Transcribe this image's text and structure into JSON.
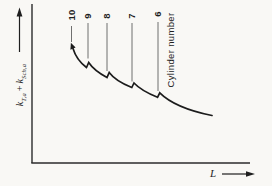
{
  "figure": {
    "y_axis": {
      "k1": "k",
      "k1_sub": "T,a",
      "plus": "+",
      "k2": "k",
      "k2_sub": "Sch,a"
    },
    "x_axis": {
      "label": "L"
    },
    "cylinder_annotation": "Cylinder number",
    "ink_color": "#1f1f1f",
    "background_color": "#f9f8f5"
  },
  "chart_data": {
    "type": "line",
    "title": "",
    "xlabel": "L",
    "ylabel": "k_T,a + k_Sch,a",
    "x_tick_labels": [],
    "y_tick_labels": [],
    "grid": false,
    "legend": null,
    "annotation": "Cylinder number",
    "cylinder_numbers": [
      "10",
      "9",
      "8",
      "7",
      "6"
    ],
    "curve": {
      "arrow_at_start": true,
      "start": [
        73,
        48.5
      ],
      "segments": [
        {
          "type": "Q",
          "cp": [
            76.5,
            60
          ],
          "end": [
            86.5,
            67.5
          ]
        },
        {
          "type": "L",
          "end": [
            88.7,
            62.5
          ]
        },
        {
          "type": "Q",
          "cp": [
            94,
            70.5
          ],
          "end": [
            107,
            77.5
          ]
        },
        {
          "type": "L",
          "end": [
            109.2,
            72.5
          ]
        },
        {
          "type": "Q",
          "cp": [
            115.5,
            81
          ],
          "end": [
            131.8,
            87.5
          ]
        },
        {
          "type": "L",
          "end": [
            134,
            83
          ]
        },
        {
          "type": "Q",
          "cp": [
            141,
            90.5
          ],
          "end": [
            157.5,
            97.3
          ]
        },
        {
          "type": "L",
          "end": [
            159.8,
            92.8
          ]
        },
        {
          "type": "C",
          "c1": [
            170,
            103
          ],
          "c2": [
            190,
            111
          ],
          "end": [
            212,
            115.5
          ]
        }
      ]
    },
    "leaders": [
      {
        "label": "10",
        "x": 71.5,
        "y1": 26,
        "y2": 42,
        "label_y": 15
      },
      {
        "label": "9",
        "x": 88,
        "y1": 23,
        "y2": 58.5,
        "label_y": 15.5
      },
      {
        "label": "8",
        "x": 107,
        "y1": 23,
        "y2": 71,
        "label_y": 15.5
      },
      {
        "label": "7",
        "x": 132,
        "y1": 23,
        "y2": 81.5,
        "label_y": 15.5
      },
      {
        "label": "6",
        "x": 158,
        "y1": 22,
        "y2": 91,
        "label_y": 14
      }
    ]
  }
}
